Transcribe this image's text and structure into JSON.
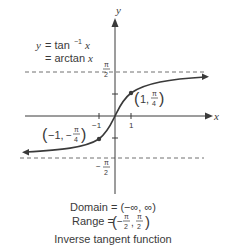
{
  "diagram": {
    "axes": {
      "x_label": "x",
      "y_label": "y"
    },
    "equation": {
      "line1": "y = tan",
      "line1_sup": "−1",
      "line1_var": "x",
      "line2": "= arctan",
      "line2_var": "x"
    },
    "asymptotes": {
      "upper": {
        "num": "π",
        "den": "2",
        "sign": ""
      },
      "lower": {
        "num": "π",
        "den": "2",
        "sign": "−"
      }
    },
    "ticks": {
      "x_pos": "1",
      "x_neg": "−1"
    },
    "points": [
      {
        "label_a": "1,",
        "num": "π",
        "den": "4",
        "sign": ""
      },
      {
        "label_a": "−1,",
        "num": "π",
        "den": "4",
        "sign": "−"
      }
    ],
    "domain": "Domain = (−∞, ∞)",
    "range_prefix": "Range =",
    "range_lower": {
      "num": "π",
      "den": "2",
      "sign": "−"
    },
    "range_upper": {
      "num": "π",
      "den": "2"
    },
    "caption": "Inverse tangent function",
    "colors": {
      "curve": "#3a3a3a",
      "dash": "#707070",
      "axis": "#3a3a3a"
    }
  }
}
